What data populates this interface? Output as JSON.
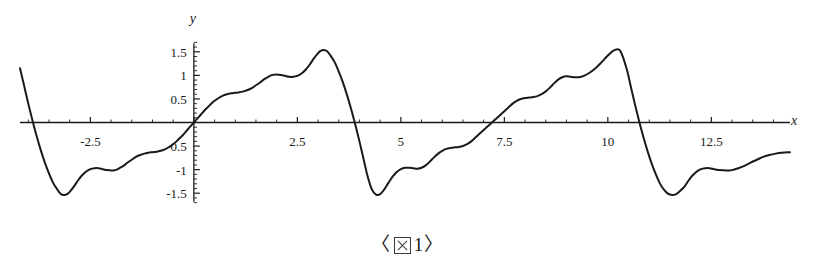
{
  "figure": {
    "caption_open_bracket": "〈",
    "caption_glyph_name": "missing-cjk-glyph-box",
    "caption_number": "1",
    "caption_close_bracket": "〉",
    "caption_full": "〈図 1〉"
  },
  "chart_data": {
    "type": "line",
    "title": "",
    "subtitle": "",
    "xlabel": "x",
    "ylabel": "y",
    "xlim": [
      -4.2,
      14.4
    ],
    "ylim": [
      -1.75,
      1.75
    ],
    "grid": false,
    "legend": "none",
    "axis_color": "#1a1a1a",
    "curve_color": "#1a1a1a",
    "curve_width": 2.0,
    "x_ticks_major": [
      -2.5,
      2.5,
      5,
      7.5,
      10,
      12.5
    ],
    "x_tick_labels": [
      "-2.5",
      "2.5",
      "5",
      "7.5",
      "10",
      "12.5"
    ],
    "x_ticks_minor_step": 0.5,
    "y_ticks_major": [
      1.5,
      1,
      0.5,
      -0.5,
      -1,
      -1.5
    ],
    "y_tick_labels": [
      "1.5",
      "1",
      "0.5",
      "-0.5",
      "-1",
      "-1.5"
    ],
    "y_ticks_minor_step": 0.1,
    "origin_label_hidden": true,
    "series": [
      {
        "name": "f(x)",
        "description": "periodic wavelet-like sawtooth, period 2π, amplitude ±1.65",
        "period": 6.2832,
        "peak_value": 1.65,
        "trough_value": -1.55,
        "zero_crossings": [
          -3.14,
          0,
          3.14,
          6.28,
          9.42,
          12.57
        ],
        "points": [
          [
            -4.2,
            1.15
          ],
          [
            -4.1,
            0.78
          ],
          [
            -4.0,
            0.4
          ],
          [
            -3.9,
            0.05
          ],
          [
            -3.8,
            -0.28
          ],
          [
            -3.7,
            -0.58
          ],
          [
            -3.6,
            -0.85
          ],
          [
            -3.5,
            -1.08
          ],
          [
            -3.4,
            -1.28
          ],
          [
            -3.3,
            -1.42
          ],
          [
            -3.22,
            -1.51
          ],
          [
            -3.14,
            -1.54
          ],
          [
            -3.06,
            -1.52
          ],
          [
            -2.98,
            -1.45
          ],
          [
            -2.9,
            -1.36
          ],
          [
            -2.8,
            -1.23
          ],
          [
            -2.7,
            -1.12
          ],
          [
            -2.6,
            -1.04
          ],
          [
            -2.5,
            -0.99
          ],
          [
            -2.4,
            -0.97
          ],
          [
            -2.3,
            -0.97
          ],
          [
            -2.2,
            -0.99
          ],
          [
            -2.1,
            -1.01
          ],
          [
            -2.0,
            -1.02
          ],
          [
            -1.9,
            -1.01
          ],
          [
            -1.8,
            -0.97
          ],
          [
            -1.7,
            -0.92
          ],
          [
            -1.6,
            -0.85
          ],
          [
            -1.5,
            -0.79
          ],
          [
            -1.4,
            -0.73
          ],
          [
            -1.3,
            -0.69
          ],
          [
            -1.2,
            -0.66
          ],
          [
            -1.1,
            -0.64
          ],
          [
            -1.0,
            -0.63
          ],
          [
            -0.9,
            -0.62
          ],
          [
            -0.8,
            -0.6
          ],
          [
            -0.7,
            -0.57
          ],
          [
            -0.6,
            -0.52
          ],
          [
            -0.5,
            -0.46
          ],
          [
            -0.42,
            -0.4
          ],
          [
            -0.34,
            -0.33
          ],
          [
            -0.26,
            -0.26
          ],
          [
            -0.18,
            -0.18
          ],
          [
            -0.1,
            -0.1
          ],
          [
            0.0,
            0.0
          ],
          [
            0.1,
            0.1
          ],
          [
            0.18,
            0.18
          ],
          [
            0.26,
            0.26
          ],
          [
            0.34,
            0.33
          ],
          [
            0.42,
            0.4
          ],
          [
            0.5,
            0.46
          ],
          [
            0.6,
            0.52
          ],
          [
            0.7,
            0.57
          ],
          [
            0.8,
            0.6
          ],
          [
            0.9,
            0.62
          ],
          [
            1.0,
            0.63
          ],
          [
            1.1,
            0.64
          ],
          [
            1.2,
            0.66
          ],
          [
            1.3,
            0.69
          ],
          [
            1.4,
            0.73
          ],
          [
            1.5,
            0.79
          ],
          [
            1.6,
            0.85
          ],
          [
            1.7,
            0.92
          ],
          [
            1.8,
            0.97
          ],
          [
            1.9,
            1.01
          ],
          [
            2.0,
            1.02
          ],
          [
            2.1,
            1.01
          ],
          [
            2.2,
            0.99
          ],
          [
            2.3,
            0.97
          ],
          [
            2.4,
            0.97
          ],
          [
            2.5,
            0.99
          ],
          [
            2.6,
            1.04
          ],
          [
            2.7,
            1.12
          ],
          [
            2.8,
            1.23
          ],
          [
            2.9,
            1.36
          ],
          [
            2.98,
            1.45
          ],
          [
            3.06,
            1.52
          ],
          [
            3.14,
            1.54
          ],
          [
            3.22,
            1.51
          ],
          [
            3.3,
            1.42
          ],
          [
            3.4,
            1.28
          ],
          [
            3.5,
            1.08
          ],
          [
            3.6,
            0.85
          ],
          [
            3.7,
            0.58
          ],
          [
            3.8,
            0.28
          ],
          [
            3.9,
            -0.05
          ],
          [
            4.0,
            -0.4
          ],
          [
            4.1,
            -0.78
          ],
          [
            4.2,
            -1.15
          ],
          [
            4.3,
            -1.42
          ],
          [
            4.4,
            -1.53
          ],
          [
            4.5,
            -1.52
          ],
          [
            4.6,
            -1.42
          ],
          [
            4.7,
            -1.28
          ],
          [
            4.8,
            -1.15
          ],
          [
            4.9,
            -1.05
          ],
          [
            5.0,
            -0.99
          ],
          [
            5.1,
            -0.96
          ],
          [
            5.2,
            -0.96
          ],
          [
            5.3,
            -0.97
          ],
          [
            5.4,
            -0.98
          ],
          [
            5.5,
            -0.96
          ],
          [
            5.6,
            -0.91
          ],
          [
            5.7,
            -0.83
          ],
          [
            5.8,
            -0.74
          ],
          [
            5.9,
            -0.66
          ],
          [
            6.0,
            -0.6
          ],
          [
            6.1,
            -0.56
          ],
          [
            6.2,
            -0.54
          ],
          [
            6.28,
            -0.53
          ],
          [
            6.4,
            -0.52
          ],
          [
            6.5,
            -0.5
          ],
          [
            6.6,
            -0.46
          ],
          [
            6.7,
            -0.4
          ],
          [
            6.8,
            -0.32
          ],
          [
            6.9,
            -0.24
          ],
          [
            7.0,
            -0.16
          ],
          [
            7.1,
            -0.08
          ],
          [
            7.2,
            0.0
          ],
          [
            7.3,
            0.08
          ],
          [
            7.4,
            0.16
          ],
          [
            7.5,
            0.24
          ],
          [
            7.6,
            0.32
          ],
          [
            7.7,
            0.4
          ],
          [
            7.8,
            0.46
          ],
          [
            7.9,
            0.5
          ],
          [
            8.0,
            0.52
          ],
          [
            8.1,
            0.53
          ],
          [
            8.2,
            0.54
          ],
          [
            8.3,
            0.56
          ],
          [
            8.4,
            0.6
          ],
          [
            8.5,
            0.66
          ],
          [
            8.6,
            0.74
          ],
          [
            8.7,
            0.83
          ],
          [
            8.8,
            0.91
          ],
          [
            8.9,
            0.96
          ],
          [
            9.0,
            0.98
          ],
          [
            9.1,
            0.97
          ],
          [
            9.2,
            0.96
          ],
          [
            9.3,
            0.96
          ],
          [
            9.42,
            0.99
          ],
          [
            9.55,
            1.05
          ],
          [
            9.7,
            1.15
          ],
          [
            9.85,
            1.28
          ],
          [
            10.0,
            1.42
          ],
          [
            10.15,
            1.53
          ],
          [
            10.3,
            1.52
          ],
          [
            10.45,
            1.15
          ],
          [
            10.55,
            0.78
          ],
          [
            10.65,
            0.4
          ],
          [
            10.75,
            0.05
          ],
          [
            10.85,
            -0.28
          ],
          [
            10.95,
            -0.58
          ],
          [
            11.05,
            -0.85
          ],
          [
            11.15,
            -1.08
          ],
          [
            11.25,
            -1.28
          ],
          [
            11.35,
            -1.42
          ],
          [
            11.45,
            -1.51
          ],
          [
            11.55,
            -1.54
          ],
          [
            11.65,
            -1.52
          ],
          [
            11.75,
            -1.45
          ],
          [
            11.85,
            -1.36
          ],
          [
            11.95,
            -1.23
          ],
          [
            12.05,
            -1.12
          ],
          [
            12.15,
            -1.04
          ],
          [
            12.25,
            -0.99
          ],
          [
            12.35,
            -0.97
          ],
          [
            12.45,
            -0.97
          ],
          [
            12.57,
            -0.99
          ],
          [
            12.7,
            -1.01
          ],
          [
            12.85,
            -1.02
          ],
          [
            13.0,
            -1.01
          ],
          [
            13.15,
            -0.97
          ],
          [
            13.3,
            -0.92
          ],
          [
            13.45,
            -0.85
          ],
          [
            13.6,
            -0.79
          ],
          [
            13.75,
            -0.73
          ],
          [
            13.9,
            -0.69
          ],
          [
            14.05,
            -0.66
          ],
          [
            14.2,
            -0.64
          ],
          [
            14.4,
            -0.63
          ]
        ]
      }
    ]
  }
}
